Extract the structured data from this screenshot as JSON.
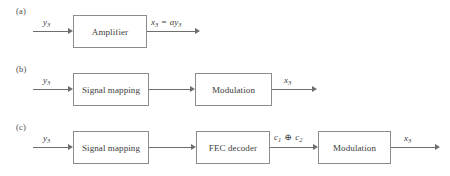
{
  "figure": {
    "rows": [
      {
        "panel_label": "(a)",
        "boxes": [
          {
            "text": "Amplifier",
            "x": 73,
            "y": 15,
            "w": 74,
            "h": 33
          }
        ],
        "inputs": [
          {
            "label_html": "y<sub>3</sub>",
            "label_text": "y3",
            "x": 33,
            "to": 73
          }
        ],
        "outputs": [
          {
            "label_html": "x<sub>3</sub> <span class=\"eq\">=</span> ay<sub>3</sub>",
            "label_text": "x3 = ay3",
            "from": 147,
            "x": 200
          }
        ]
      },
      {
        "panel_label": "(b)",
        "boxes": [
          {
            "text": "Signal mapping",
            "x": 73,
            "y": 15,
            "w": 76,
            "h": 33
          },
          {
            "text": "Modulation",
            "x": 195,
            "y": 15,
            "w": 77,
            "h": 33
          }
        ],
        "inputs": [
          {
            "label_html": "y<sub>3</sub>",
            "label_text": "y3",
            "x": 33,
            "to": 73
          }
        ],
        "outputs": [
          {
            "label_html": "x<sub>3</sub>",
            "label_text": "x3",
            "from": 272,
            "x": 317
          }
        ]
      },
      {
        "panel_label": "(c)",
        "boxes": [
          {
            "text": "Signal mapping",
            "x": 73,
            "y": 15,
            "w": 76,
            "h": 33
          },
          {
            "text": "FEC decoder",
            "x": 196,
            "y": 15,
            "w": 74,
            "h": 33
          },
          {
            "text": "Modulation",
            "x": 318,
            "y": 15,
            "w": 73,
            "h": 33
          }
        ],
        "inputs": [
          {
            "label_html": "y<sub>3</sub>",
            "label_text": "y3",
            "x": 33,
            "to": 73
          }
        ],
        "mid_label": {
          "label_html": "c<sub>1</sub> <span class=\"op\">&#8853;</span> c<sub>2</sub>",
          "label_text": "c1 XOR c2"
        },
        "outputs": [
          {
            "label_html": "x<sub>3</sub>",
            "label_text": "x3",
            "from": 391,
            "x": 440
          }
        ]
      }
    ],
    "colors": {
      "box_border": "#8c8c8c",
      "line": "#6e6e6e",
      "text": "#3b3b3b",
      "background": "#ffffff"
    }
  }
}
